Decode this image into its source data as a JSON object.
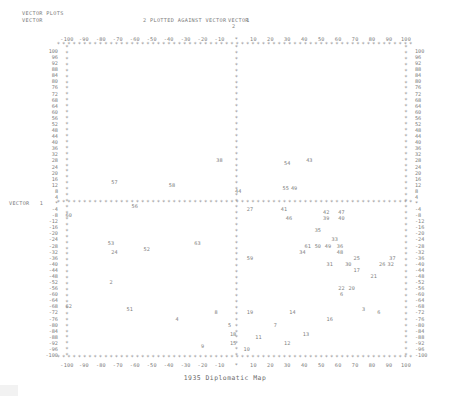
{
  "header": {
    "line1": "VECTOR PLOTS",
    "line2": "VECTOR",
    "line2_rest": "2 PLOTTED AGAINST VECTOR",
    "against_index": "1",
    "right_label": "VECTOR",
    "right_index": "2"
  },
  "axes": {
    "y_left_title": "VECTOR",
    "y_left_index": "1",
    "x_ticks": [
      "-100",
      "-90",
      "-80",
      "-70",
      "-60",
      "-50",
      "-40",
      "-30",
      "-20",
      "-10",
      "*",
      "10",
      "20",
      "30",
      "40",
      "50",
      "60",
      "70",
      "80",
      "90",
      "100"
    ],
    "y_ticks": [
      "100",
      "96",
      "92",
      "88",
      "84",
      "80",
      "76",
      "72",
      "68",
      "64",
      "60",
      "56",
      "52",
      "48",
      "44",
      "40",
      "36",
      "32",
      "28",
      "24",
      "20",
      "16",
      "12",
      "8",
      "4",
      "*",
      "-4",
      "-8",
      "-12",
      "-16",
      "-20",
      "-24",
      "-28",
      "-32",
      "-36",
      "-40",
      "-44",
      "-48",
      "-52",
      "-56",
      "-60",
      "-64",
      "-68",
      "-72",
      "-76",
      "-80",
      "-84",
      "-88",
      "-92",
      "-96",
      "-100"
    ],
    "xlim": [
      -110,
      110
    ],
    "ylim": [
      -104,
      104
    ],
    "marker": "*"
  },
  "caption": "1935 Diplomatic Map",
  "chart_data": {
    "type": "scatter",
    "title": "1935 Diplomatic Map",
    "subtitle": "VECTOR 2 PLOTTED AGAINST VECTOR 1",
    "xlabel": "VECTOR 2",
    "ylabel": "VECTOR 1",
    "xlim": [
      -110,
      110
    ],
    "ylim": [
      -104,
      104
    ],
    "grid": false,
    "legend": "none",
    "point_label_field": "id",
    "points": [
      {
        "id": "38",
        "x": -10,
        "y": 28
      },
      {
        "id": "57",
        "x": -72,
        "y": 14
      },
      {
        "id": "58",
        "x": -38,
        "y": 12
      },
      {
        "id": "54",
        "x": 30,
        "y": 26
      },
      {
        "id": "43",
        "x": 43,
        "y": 28
      },
      {
        "id": "44",
        "x": 1,
        "y": 8
      },
      {
        "id": "55",
        "x": 29,
        "y": 10
      },
      {
        "id": "49",
        "x": 34,
        "y": 10
      },
      {
        "id": "60",
        "x": -99,
        "y": -8
      },
      {
        "id": "56",
        "x": -60,
        "y": -2
      },
      {
        "id": "27",
        "x": 8,
        "y": -4
      },
      {
        "id": "41",
        "x": 28,
        "y": -4
      },
      {
        "id": "42",
        "x": 53,
        "y": -6
      },
      {
        "id": "47",
        "x": 62,
        "y": -6
      },
      {
        "id": "46",
        "x": 31,
        "y": -10
      },
      {
        "id": "39",
        "x": 53,
        "y": -10
      },
      {
        "id": "40",
        "x": 62,
        "y": -10
      },
      {
        "id": "35",
        "x": 48,
        "y": -18
      },
      {
        "id": "53",
        "x": -74,
        "y": -26
      },
      {
        "id": "63",
        "x": -23,
        "y": -26
      },
      {
        "id": "33",
        "x": 58,
        "y": -24
      },
      {
        "id": "61",
        "x": 42,
        "y": -28
      },
      {
        "id": "50",
        "x": 48,
        "y": -28
      },
      {
        "id": "49b",
        "x": 54,
        "y": -28
      },
      {
        "id": "36",
        "x": 61,
        "y": -28
      },
      {
        "id": "24",
        "x": -72,
        "y": -32
      },
      {
        "id": "52",
        "x": -53,
        "y": -30
      },
      {
        "id": "34",
        "x": 39,
        "y": -32
      },
      {
        "id": "48",
        "x": 61,
        "y": -32
      },
      {
        "id": "59",
        "x": 8,
        "y": -36
      },
      {
        "id": "25",
        "x": 71,
        "y": -36
      },
      {
        "id": "37",
        "x": 92,
        "y": -36
      },
      {
        "id": "31",
        "x": 55,
        "y": -40
      },
      {
        "id": "30",
        "x": 66,
        "y": -40
      },
      {
        "id": "26",
        "x": 86,
        "y": -40
      },
      {
        "id": "32",
        "x": 91,
        "y": -40
      },
      {
        "id": "17",
        "x": 71,
        "y": -44
      },
      {
        "id": "21",
        "x": 81,
        "y": -48
      },
      {
        "id": "2",
        "x": -74,
        "y": -52
      },
      {
        "id": "22",
        "x": 62,
        "y": -56
      },
      {
        "id": "20",
        "x": 68,
        "y": -56
      },
      {
        "id": "6",
        "x": 62,
        "y": -60
      },
      {
        "id": "62",
        "x": -99,
        "y": -68
      },
      {
        "id": "51",
        "x": -63,
        "y": -70
      },
      {
        "id": "8",
        "x": -12,
        "y": -72
      },
      {
        "id": "19",
        "x": 8,
        "y": -72
      },
      {
        "id": "14",
        "x": 33,
        "y": -72
      },
      {
        "id": "3",
        "x": 75,
        "y": -70
      },
      {
        "id": "6b",
        "x": 84,
        "y": -72
      },
      {
        "id": "4",
        "x": -35,
        "y": -76
      },
      {
        "id": "16",
        "x": 55,
        "y": -76
      },
      {
        "id": "5",
        "x": -4,
        "y": -80
      },
      {
        "id": "7",
        "x": 23,
        "y": -80
      },
      {
        "id": "18",
        "x": -2,
        "y": -86
      },
      {
        "id": "13",
        "x": 41,
        "y": -86
      },
      {
        "id": "11",
        "x": 13,
        "y": -88
      },
      {
        "id": "15",
        "x": -2,
        "y": -92
      },
      {
        "id": "9",
        "x": -20,
        "y": -94
      },
      {
        "id": "12",
        "x": 30,
        "y": -92
      },
      {
        "id": "10",
        "x": 6,
        "y": -96
      }
    ]
  }
}
